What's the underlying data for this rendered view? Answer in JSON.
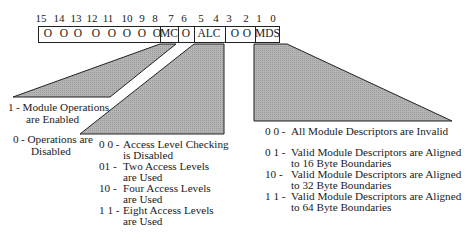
{
  "bit_numbers": [
    "15",
    "14",
    "13",
    "12",
    "11",
    "10",
    "9",
    "8",
    "7",
    "6",
    "5",
    "4",
    "3",
    "2",
    "1",
    "0"
  ],
  "register": {
    "reserved_high": [
      "O",
      "O",
      "O",
      "O",
      "O",
      "O",
      "O"
    ],
    "bit8": "O",
    "mc": "MC",
    "bit6": "O",
    "alc": "ALC",
    "bits32": [
      "O",
      "O"
    ],
    "mds": "MDS"
  },
  "mc_field": {
    "line1_code": "1",
    "line1_text": "- Module Operations",
    "line1_cont": "are Enabled",
    "line2_code": "0",
    "line2_text": "- Operations are",
    "line2_cont": "Disabled"
  },
  "alc_field": {
    "entries": [
      {
        "code": "0 0 -",
        "text": "Access Level Checking",
        "cont": "is Disabled"
      },
      {
        "code": "01  -",
        "text": " Two Access Levels",
        "cont": "are Used"
      },
      {
        "code": "10  -",
        "text": " Four Access Levels",
        "cont": "are Used"
      },
      {
        "code": "1 1 -",
        "text": "Eight Access Levels",
        "cont": "are Used"
      }
    ]
  },
  "mds_field": {
    "entries": [
      {
        "code": "0 0  -",
        "text": "All Module Descriptors are Invalid",
        "cont": ""
      },
      {
        "code": "0 1  -",
        "text": "Valid Module Descriptors are Aligned",
        "cont": "to 16 Byte Boundaries"
      },
      {
        "code": "10   -",
        "text": "  Valid Module Descriptors are Aligned",
        "cont": "to 32 Byte Boundaries"
      },
      {
        "code": "1 1 -",
        "text": "Valid Module Descriptors are Aligned",
        "cont": "to 64 Byte Boundaries"
      }
    ]
  },
  "colors": {
    "shade": "#a9a9a9",
    "stroke": "#222222"
  }
}
